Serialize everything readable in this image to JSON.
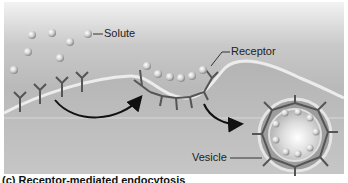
{
  "figure": {
    "labels": {
      "solute": "Solute",
      "receptor": "Receptor",
      "vesicle": "Vesicle"
    },
    "caption": "(c) Receptor-mediated endocytosis",
    "colors": {
      "background_top": "#f3f3f3",
      "background_mid": "#b9b9b9",
      "membrane": "#e8e8e8",
      "receptor": "#555555",
      "solute": "#d8d8d8",
      "arrow": "#111111"
    }
  }
}
